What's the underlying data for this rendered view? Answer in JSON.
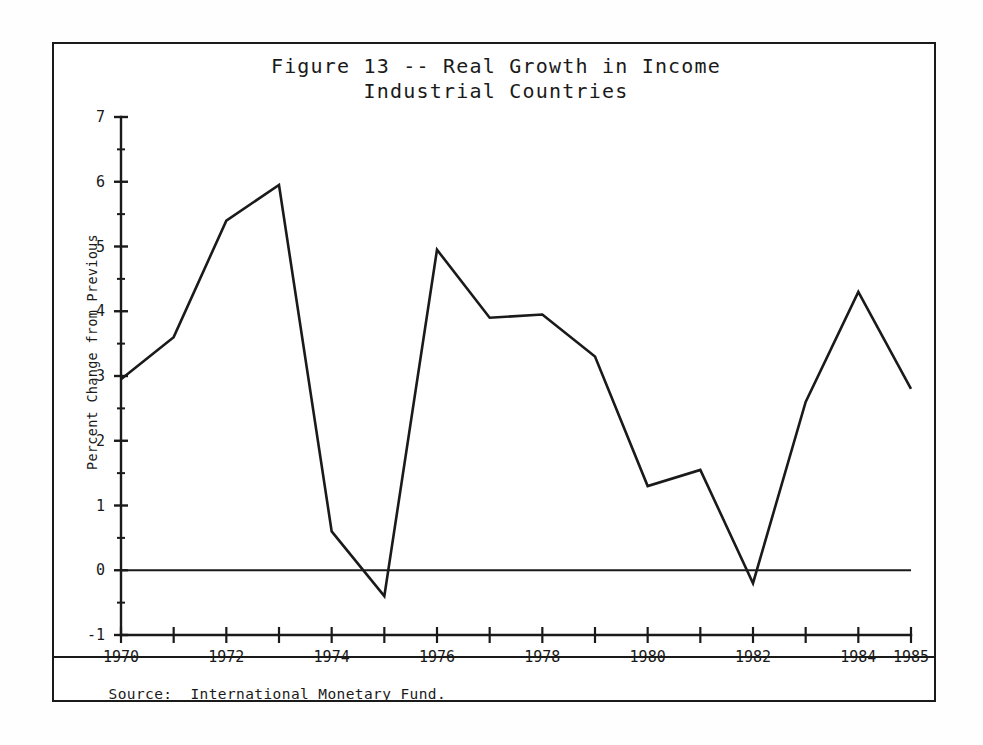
{
  "figure": {
    "title_line1": "Figure 13 -- Real Growth in Income",
    "title_line2": "Industrial Countries",
    "source_label": "Source:",
    "source_text": "International Monetary Fund.",
    "line_color": "#1a1a1a",
    "axis_color": "#1a1a1a",
    "background_color": "#ffffff"
  },
  "chart_data": {
    "type": "line",
    "title": "Figure 13 -- Real Growth in Income\nIndustrial Countries",
    "xlabel": "",
    "ylabel": "Percent Change from Previous",
    "x": [
      1970,
      1971,
      1972,
      1973,
      1974,
      1975,
      1976,
      1977,
      1978,
      1979,
      1980,
      1981,
      1982,
      1983,
      1984,
      1985
    ],
    "values": [
      2.95,
      3.6,
      5.4,
      5.95,
      0.6,
      -0.4,
      4.95,
      3.9,
      3.95,
      3.3,
      1.3,
      1.55,
      -0.2,
      2.6,
      4.3,
      2.8
    ],
    "series": [
      {
        "name": "Real Growth in Income, Industrial Countries",
        "values": [
          2.95,
          3.6,
          5.4,
          5.95,
          0.6,
          -0.4,
          4.95,
          3.9,
          3.95,
          3.3,
          1.3,
          1.55,
          -0.2,
          2.6,
          4.3,
          2.8
        ]
      }
    ],
    "xlim": [
      1970,
      1985
    ],
    "ylim": [
      -1,
      7
    ],
    "ytick_values": [
      7,
      6,
      5,
      4,
      3,
      2,
      1,
      0,
      -1
    ],
    "ytick_labels": [
      "7",
      "6",
      "5",
      "4",
      "3",
      "2",
      "1",
      "0",
      "-1"
    ],
    "yminor_values": [
      6.5,
      5.5,
      4.5,
      3.5,
      2.5,
      1.5,
      0.5,
      -0.5
    ],
    "xtick_values": [
      1970,
      1971,
      1972,
      1973,
      1974,
      1975,
      1976,
      1977,
      1978,
      1979,
      1980,
      1981,
      1982,
      1983,
      1984,
      1985
    ],
    "xtick_labeled": [
      {
        "value": 1970,
        "label": "1970"
      },
      {
        "value": 1972,
        "label": "1972"
      },
      {
        "value": 1974,
        "label": "1974"
      },
      {
        "value": 1976,
        "label": "1976"
      },
      {
        "value": 1978,
        "label": "1978"
      },
      {
        "value": 1980,
        "label": "1980"
      },
      {
        "value": 1982,
        "label": "1982"
      },
      {
        "value": 1984,
        "label": "1984"
      },
      {
        "value": 1985,
        "label": "1985"
      }
    ],
    "grid": false,
    "legend": null,
    "zero_line": true,
    "annotations": []
  }
}
